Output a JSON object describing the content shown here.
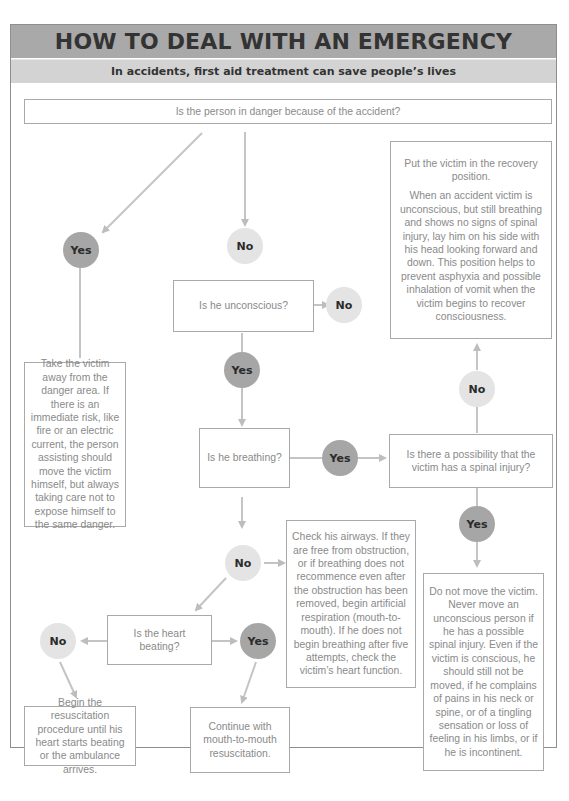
{
  "header": {
    "title": "HOW TO DEAL WITH AN EMERGENCY",
    "subtitle": "In accidents, first aid treatment can save people’s lives"
  },
  "colors": {
    "title_band": "#a9a9a9",
    "subtitle_band": "#d3d3d3",
    "yes_circle": "#a6a6a6",
    "no_circle": "#e4e4e4",
    "box_border": "#a9a9a9",
    "text": "#8a8a8a",
    "arrow": "#c4c4c4"
  },
  "questions": {
    "danger": "Is the person in danger because of the accident?",
    "unconscious": "Is he unconscious?",
    "breathing": "Is he breathing?",
    "spinal": "Is there a possibility that the victim has a spinal injury?",
    "heart": "Is the heart beating?"
  },
  "answers": {
    "yes": "Yes",
    "no": "No"
  },
  "instructions": {
    "move_victim": "Take the victim away from the danger area. If there is an immediate risk, like fire or an electric current, the person assisting should move the victim himself, but always taking care not to expose himself to the same danger.",
    "recovery_title": "Put the victim in the recovery position.",
    "recovery_body": "When an accident victim is unconscious, but still breathing and shows no signs of spinal injury, lay him on his side with his head looking forward and down. This position helps to prevent asphyxia and possible inhalation of vomit when the victim begins to recover consciousness.",
    "airways": "Check his airways. If they are free from obstruction, or if breathing does not recommence even after the obstruction has been removed, begin artificial respiration (mouth-to-mouth). If he does not begin breathing after five attempts, check the victim’s heart function.",
    "do_not_move": "Do not move the victim. Never move an unconscious person if he has a possible spinal injury. Even if the victim is conscious, he should still not be moved, if he complains of pains in his neck or spine, or of a tingling sensation or loss of feeling in his limbs, or if he is incontinent.",
    "resuscitation": "Begin the resuscitation procedure until his heart starts beating or the ambulance arrives.",
    "continue_mouth": "Continue with mouth-to-mouth resuscitation."
  }
}
